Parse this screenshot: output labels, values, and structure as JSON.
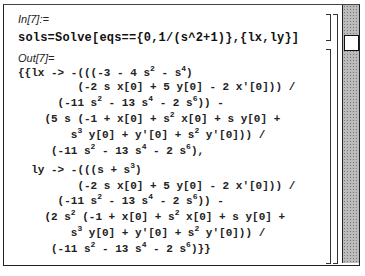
{
  "notebook": {
    "input_label": "In[7]:=",
    "input_text": "sols=Solve[eqs=={0,1/(s^2+1)},{lx,ly}]",
    "output_label": "Out[7]=",
    "output_lines": [
      {
        "indent": 0,
        "html": "{{lx -> -(((-3 - 4 s<sup>2</sup> - s<sup>4</sup>)"
      },
      {
        "indent": 9,
        "html": "(-2 s x[0] + 5 y[0] - 2 x'[0])) /"
      },
      {
        "indent": 6,
        "html": "(-11 s<sup>2</sup> - 13 s<sup>4</sup> - 2 s<sup>6</sup>)) -"
      },
      {
        "indent": 4,
        "html": "(5 s (-1 + x[0] + s<sup>2</sup> x[0] + s y[0] +"
      },
      {
        "indent": 8,
        "html": "s<sup>3</sup> y[0] + y'[0] + s<sup>2</sup> y'[0])) /"
      },
      {
        "indent": 5,
        "html": "(-11 s<sup>2</sup> - 13 s<sup>4</sup> - 2 s<sup>6</sup>),"
      },
      {
        "indent": 2,
        "html": "ly -> -(((s + s<sup>3</sup>)"
      },
      {
        "indent": 9,
        "html": "(-2 s x[0] + 5 y[0] - 2 x'[0])) /"
      },
      {
        "indent": 6,
        "html": "(-11 s<sup>2</sup> - 13 s<sup>4</sup> - 2 s<sup>6</sup>)) -"
      },
      {
        "indent": 4,
        "html": "(2 s<sup>2</sup> (-1 + x[0] + s<sup>2</sup> x[0] + s y[0] +"
      },
      {
        "indent": 8,
        "html": "s<sup>3</sup> y[0] + y'[0] + s<sup>2</sup> y'[0])) /"
      },
      {
        "indent": 5,
        "html": "(-11 s<sup>2</sup> - 13 s<sup>4</sup> - 2 s<sup>6</sup>)}}"
      }
    ]
  },
  "scrollbar": {
    "position": 0.12
  }
}
